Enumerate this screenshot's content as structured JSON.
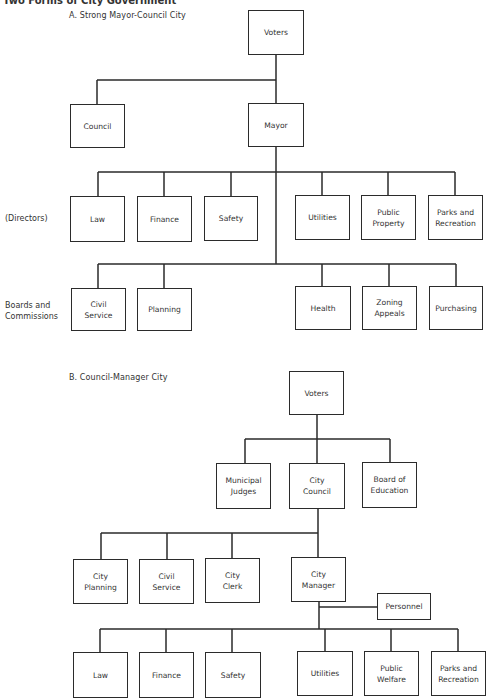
{
  "page_title": "Two Forms of City Government",
  "chart_a": {
    "subtitle": "A.  Strong Mayor-Council City",
    "row_labels": {
      "directors": "(Directors)",
      "boards": "Boards and\nCommissions"
    },
    "nodes": {
      "voters": "Voters",
      "council": "Council",
      "mayor": "Mayor",
      "law": "Law",
      "finance": "Finance",
      "safety": "Safety",
      "utilities": "Utilities",
      "public_property": "Public\nProperty",
      "parks": "Parks and\nRecreation",
      "civil_service": "Civil\nService",
      "planning": "Planning",
      "health": "Health",
      "zoning": "Zoning\nAppeals",
      "purchasing": "Purchasing"
    }
  },
  "chart_b": {
    "subtitle": "B.  Council-Manager City",
    "nodes": {
      "voters": "Voters",
      "judges": "Municipal\nJudges",
      "city_council": "City\nCouncil",
      "education": "Board of\nEducation",
      "city_planning": "City\nPlanning",
      "civil_service": "Civil\nService",
      "city_clerk": "City\nClerk",
      "city_manager": "City\nManager",
      "personnel": "Personnel",
      "law": "Law",
      "finance": "Finance",
      "safety": "Safety",
      "utilities": "Utilities",
      "public_welfare": "Public\nWelfare",
      "parks": "Parks and\nRecreation"
    }
  }
}
